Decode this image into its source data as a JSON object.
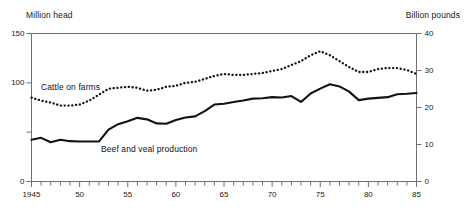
{
  "chart_data": {
    "type": "line",
    "title": "",
    "xlabel": "",
    "ylabel": "Million head",
    "y2label": "Billion pounds",
    "grid": false,
    "legend_position": "inline-annotation",
    "xlim": [
      1945,
      1985
    ],
    "ylim": [
      0,
      150
    ],
    "y2lim": [
      0,
      40
    ],
    "x_tick_labels": [
      "1945",
      "50",
      "55",
      "60",
      "65",
      "70",
      "75",
      "80",
      "85"
    ],
    "x_tick_values": [
      1945,
      1950,
      1955,
      1960,
      1965,
      1970,
      1975,
      1980,
      1985
    ],
    "x_minor_tick_interval": 1,
    "y_left_tick_labels": [
      "0",
      "100",
      "150"
    ],
    "y_left_tick_values": [
      0,
      100,
      150
    ],
    "y_left_unlabeled_ticks": [
      50
    ],
    "y_right_tick_labels": [
      "0",
      "10",
      "20",
      "30",
      "40"
    ],
    "y_right_tick_values": [
      0,
      10,
      20,
      30,
      40
    ],
    "x": [
      1945,
      1946,
      1947,
      1948,
      1949,
      1950,
      1951,
      1952,
      1953,
      1954,
      1955,
      1956,
      1957,
      1958,
      1959,
      1960,
      1961,
      1962,
      1963,
      1964,
      1965,
      1966,
      1967,
      1968,
      1969,
      1970,
      1971,
      1972,
      1973,
      1974,
      1975,
      1976,
      1977,
      1978,
      1979,
      1980,
      1981,
      1982,
      1983,
      1984,
      1985
    ],
    "series": [
      {
        "name": "Cattle on farms",
        "axis": "left",
        "units": "Million head",
        "style": "dotted",
        "color": "#121212",
        "values": [
          85,
          82,
          80,
          77,
          77,
          78,
          82,
          88,
          94,
          95,
          96,
          95,
          92,
          93,
          96,
          97,
          100,
          101,
          104,
          107,
          109,
          108,
          108,
          109,
          110,
          112,
          114,
          118,
          122,
          128,
          132,
          128,
          122,
          116,
          111,
          111,
          114,
          115,
          115,
          113,
          109
        ]
      },
      {
        "name": "Beef and veal production",
        "axis": "right",
        "units": "Billion pounds",
        "style": "solid",
        "color": "#121212",
        "values": [
          11.3,
          11.8,
          10.6,
          11.3,
          10.9,
          10.8,
          10.8,
          10.8,
          14.0,
          15.5,
          16.3,
          17.2,
          16.8,
          15.7,
          15.6,
          16.6,
          17.3,
          17.6,
          19.0,
          20.8,
          21.0,
          21.5,
          21.9,
          22.4,
          22.5,
          22.8,
          22.7,
          23.1,
          21.5,
          23.8,
          25.1,
          26.3,
          25.7,
          24.3,
          22.0,
          22.4,
          22.6,
          22.8,
          23.6,
          23.7,
          23.9
        ]
      }
    ]
  },
  "labels": {
    "left_unit": "Million head",
    "right_unit": "Billion pounds",
    "cattle_series": "Cattle on farms",
    "beef_series": "Beef and veal production"
  },
  "colors": {
    "ink": "#121212",
    "axis": "#6f6f6f",
    "background": "#ffffff"
  }
}
